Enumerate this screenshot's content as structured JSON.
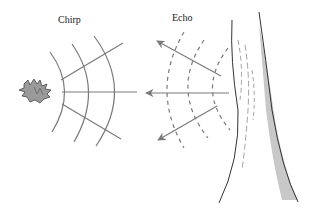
{
  "diagram": {
    "labels": {
      "chirp": "Chirp",
      "echo": "Echo"
    },
    "elements": {
      "source": "bat",
      "reflector": "tree-trunk",
      "outgoing_wavefronts": 3,
      "echo_wavefronts": 3,
      "outgoing_rays": 3,
      "echo_rays": 3
    },
    "colors": {
      "wave": "#7a7a7a",
      "ray": "#7a7a7a",
      "tree_outline": "#333333",
      "tree_shade": "#c8c8c8",
      "bat": "#8a8a8a",
      "text": "#222222"
    }
  }
}
